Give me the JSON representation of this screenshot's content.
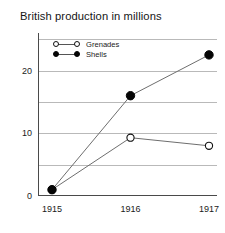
{
  "chart_data": {
    "type": "line",
    "title": "British production in millions",
    "xlabel": "",
    "ylabel": "",
    "categories": [
      "1915",
      "1916",
      "1917"
    ],
    "x": [
      1915,
      1916,
      1917
    ],
    "series": [
      {
        "name": "Grenades",
        "marker": "open-circle",
        "color": "#111111",
        "values": [
          1,
          9.3,
          8
        ]
      },
      {
        "name": "Shells",
        "marker": "filled-circle",
        "color": "#050505",
        "values": [
          1,
          16,
          22.5
        ]
      }
    ],
    "ylim": [
      0,
      26
    ],
    "xlim": [
      1914.8,
      1917.2
    ],
    "yticks": [
      0,
      10,
      20
    ],
    "ytick_labels": [
      "0",
      "10",
      "20"
    ],
    "xtick_labels": [
      "1915",
      "1916",
      "1917"
    ],
    "gridlines": [
      5,
      10,
      15,
      20,
      25
    ],
    "grid": true,
    "grid_color": "#b9b9b9",
    "legend_position": "top-left-inside",
    "axis_color": "#4a4a4a",
    "line_color": "#6e6e6e"
  },
  "legend": {
    "items": [
      {
        "label": "Grenades"
      },
      {
        "label": "Shells"
      }
    ]
  }
}
